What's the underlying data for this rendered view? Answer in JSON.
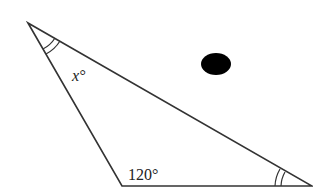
{
  "diagram": {
    "type": "triangle",
    "vertices": {
      "top_left": [
        28,
        23
      ],
      "bottom_left": [
        122,
        186
      ],
      "bottom_right": [
        312,
        186
      ]
    },
    "angle_labels": {
      "top_left": "x°",
      "bottom_left": "120°"
    },
    "angle_marks": {
      "top_left": "double-arc",
      "bottom_right": "double-arc"
    },
    "stroke_color": "#333333",
    "dot": {
      "cx": 216,
      "cy": 64,
      "rx": 15,
      "ry": 11,
      "color": "#000000"
    }
  }
}
